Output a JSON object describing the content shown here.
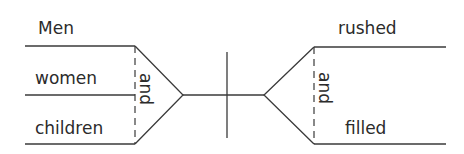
{
  "diagram": {
    "type": "sentence-diagram",
    "subject": {
      "conjunction": "and",
      "words": [
        "Men",
        "women",
        "children"
      ]
    },
    "predicate": {
      "conjunction": "and",
      "words": [
        "rushed",
        "filled"
      ]
    },
    "colors": {
      "line": "#3a3a3a",
      "text": "#2b2b2b",
      "background": "#ffffff"
    }
  }
}
